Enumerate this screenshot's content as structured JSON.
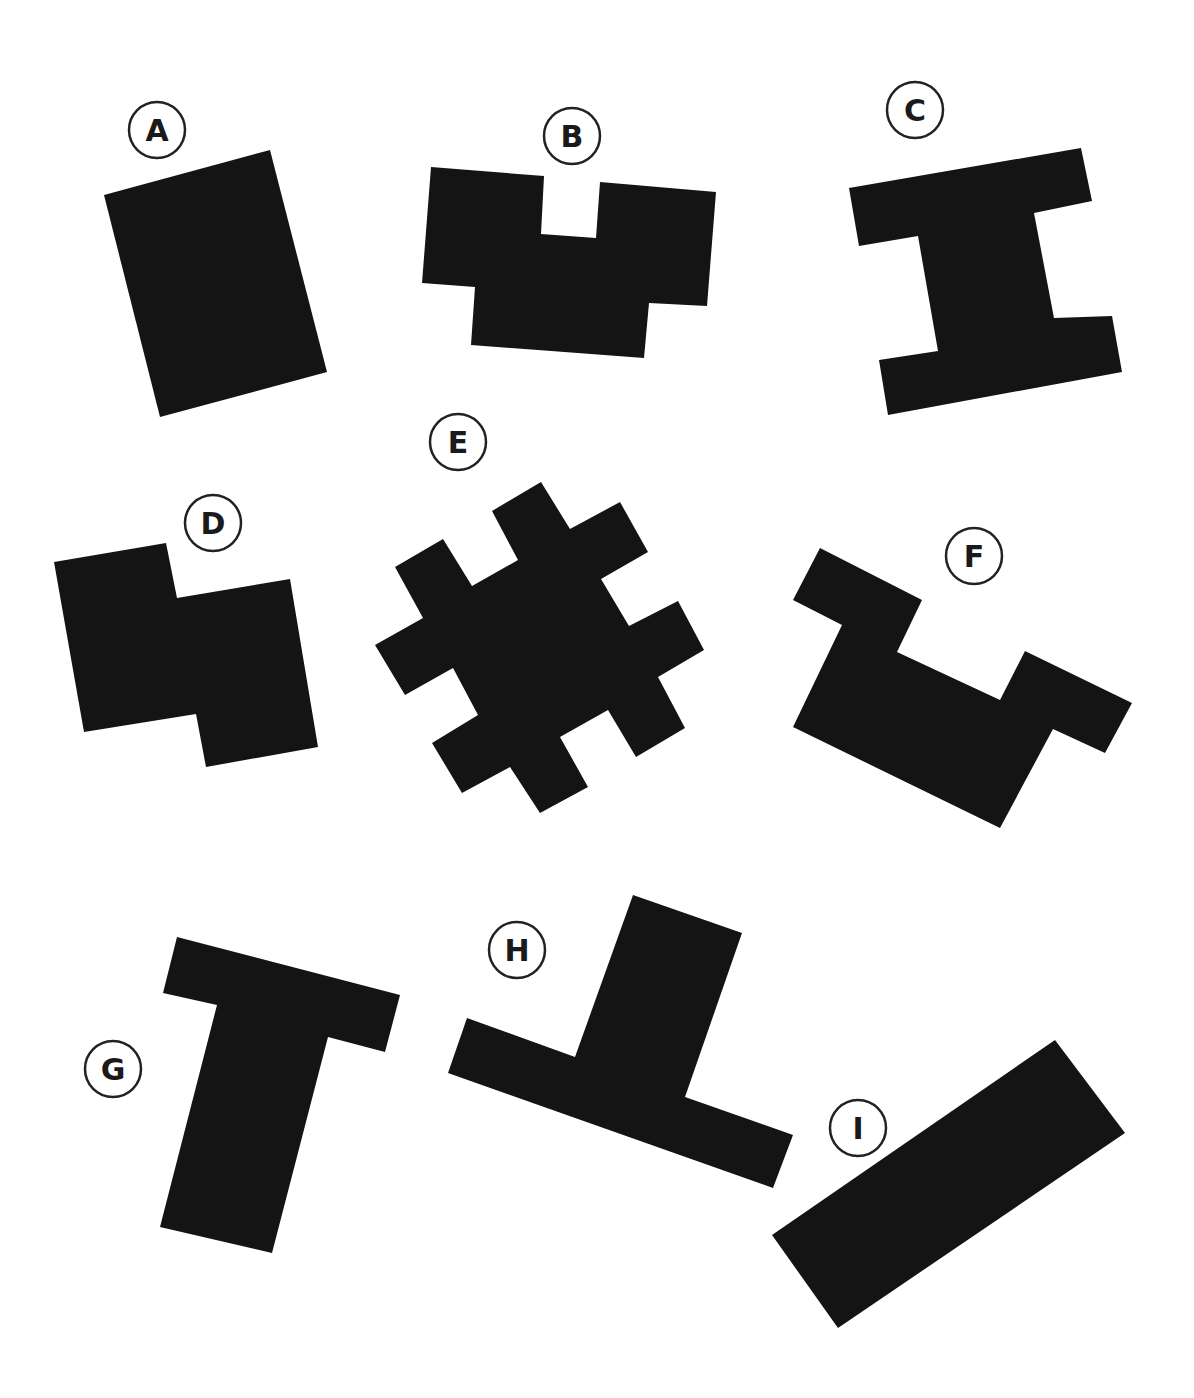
{
  "figure": {
    "background": "#ffffff",
    "shape_color": "#141414",
    "label_stroke": "#222222",
    "shapes": [
      {
        "id": "A",
        "label": "A",
        "label_pos": [
          157,
          130
        ],
        "points": "104,195 270,150 327,372 160,417"
      },
      {
        "id": "B",
        "label": "B",
        "label_pos": [
          572,
          136
        ],
        "points": "431,167 544,176 541,234 596,238 600,182 716,192 707,306 649,303 644,358 471,345 475,287 422,283"
      },
      {
        "id": "C",
        "label": "C",
        "label_pos": [
          915,
          110
        ],
        "points": "849,188 1081,148 1092,201 1034,213 1054,318 1112,316 1122,372 888,415 879,360 938,351 918,236 859,246"
      },
      {
        "id": "D",
        "label": "D",
        "label_pos": [
          213,
          523
        ],
        "points": "54,562 166,543 177,598 290,579 318,747 206,767 196,714 84,732"
      },
      {
        "id": "E",
        "label": "E",
        "label_pos": [
          458,
          442
        ],
        "points": "492,511 541,482 570,529 620,502 648,552 601,579 629,626 678,601 704,650 658,677 685,728 636,757 608,710 560,737 588,787 540,813 510,767 462,793 432,743 478,715 453,668 405,695 375,645 423,618 395,567 443,539 472,586 518,560"
      },
      {
        "id": "F",
        "label": "F",
        "label_pos": [
          974,
          556
        ],
        "points": "820,548 922,600 897,652 1000,700 1025,651 1132,703 1105,753 1053,729 1000,828 793,727 842,625 793,600"
      },
      {
        "id": "G",
        "label": "G",
        "label_pos": [
          113,
          1069
        ],
        "points": "177,937 400,995 385,1052 328,1037 272,1253 160,1227 217,1005 163,993"
      },
      {
        "id": "H",
        "label": "H",
        "label_pos": [
          517,
          950
        ],
        "points": "633,895 742,933 685,1097 793,1135 773,1188 448,1073 467,1018 575,1057"
      },
      {
        "id": "I",
        "label": "I",
        "label_pos": [
          858,
          1128
        ],
        "points": "1055,1040 1125,1133 838,1328 772,1235"
      }
    ]
  }
}
